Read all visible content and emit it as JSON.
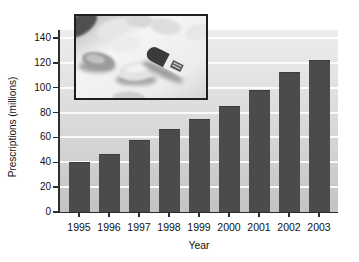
{
  "chart_data": {
    "type": "bar",
    "title": "",
    "xlabel": "Year",
    "ylabel": "Prescriptions (millions)",
    "categories": [
      "1995",
      "1996",
      "1997",
      "1998",
      "1999",
      "2000",
      "2001",
      "2002",
      "2003"
    ],
    "values": [
      40,
      47,
      58,
      67,
      75,
      85,
      98,
      113,
      122
    ],
    "ylim": [
      0,
      140
    ],
    "yticks": [
      0,
      20,
      40,
      60,
      80,
      100,
      120,
      140
    ],
    "grid": "horizontal-white-lines",
    "legend": "none",
    "bar_color": "#4b4b4b",
    "plot_bg_top": "#ededed",
    "plot_bg_bottom": "#c3c3c3",
    "axis_color": "#2e2e2e"
  },
  "images": {
    "inset_photo": "grayscale close-up photo of pill tablets and a two-tone capsule",
    "inset_border_color": "#1f1f1f"
  }
}
